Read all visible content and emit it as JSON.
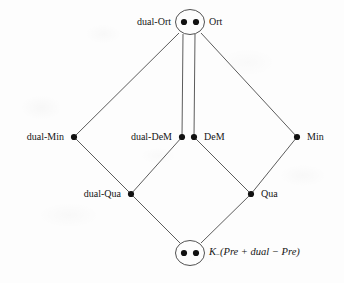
{
  "figure": {
    "type": "hasse-diagram",
    "background_color": "#fdfdfd",
    "line_color": "#4a4a4a",
    "node_color": "#111111"
  },
  "nodes": [
    {
      "id": "top",
      "label_left": "dual-Ort",
      "label_right": "Ort",
      "x": 190,
      "y": 22,
      "style": "double-dot-circled",
      "dot_left_x": 184,
      "dot_right_x": 196,
      "circle_rx": 14,
      "circle_ry": 12
    },
    {
      "id": "dual-min",
      "label_left": "dual-Min",
      "label_right": "",
      "x": 74,
      "y": 137,
      "style": "single-dot"
    },
    {
      "id": "dem",
      "label_left": "dual-DeM",
      "label_right": "DeM",
      "x": 187,
      "y": 137,
      "style": "double-dot",
      "dot_left_x": 182,
      "dot_right_x": 194
    },
    {
      "id": "min",
      "label_left": "",
      "label_right": "Min",
      "x": 297,
      "y": 137,
      "style": "single-dot"
    },
    {
      "id": "dual-qua",
      "label_left": "dual-Qua",
      "label_right": "",
      "x": 131,
      "y": 194,
      "style": "single-dot"
    },
    {
      "id": "qua",
      "label_left": "",
      "label_right": "Qua",
      "x": 251,
      "y": 194,
      "style": "single-dot"
    },
    {
      "id": "bottom",
      "label_left": "",
      "label_right": "K_(Pre + dual - Pre)",
      "x": 190,
      "y": 253,
      "style": "double-dot-circled",
      "dot_left_x": 184,
      "dot_right_x": 196,
      "circle_rx": 14,
      "circle_ry": 12
    }
  ],
  "labels": {
    "dual_ort": "dual-Ort",
    "ort": "Ort",
    "dual_min": "dual-Min",
    "dual_dem": "dual-DeM",
    "dem": "DeM",
    "min": "Min",
    "dual_qua": "dual-Qua",
    "qua": "Qua",
    "bottom_k": "K",
    "bottom_sub": "−",
    "bottom_expr": "(Pre + dual − Pre)"
  },
  "edges": [
    {
      "from": "top",
      "to": "dual-min",
      "kind": "single"
    },
    {
      "from": "top",
      "to": "min",
      "kind": "single"
    },
    {
      "from": "top",
      "to": "dem",
      "kind": "double-vertical"
    },
    {
      "from": "dual-min",
      "to": "dual-qua",
      "kind": "single"
    },
    {
      "from": "dem",
      "to": "dual-qua",
      "kind": "single"
    },
    {
      "from": "dem",
      "to": "qua",
      "kind": "single"
    },
    {
      "from": "min",
      "to": "qua",
      "kind": "single"
    },
    {
      "from": "dual-qua",
      "to": "bottom",
      "kind": "single"
    },
    {
      "from": "qua",
      "to": "bottom",
      "kind": "single"
    }
  ]
}
